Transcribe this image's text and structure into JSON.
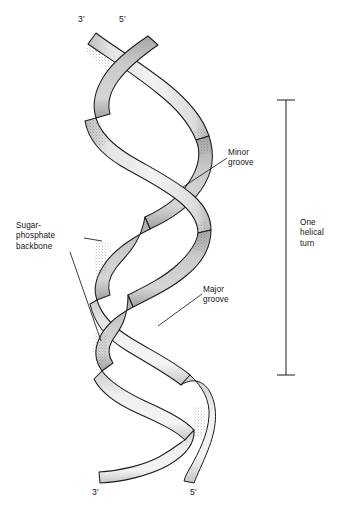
{
  "figure": {
    "background_color": "#ffffff",
    "line_color": "#1a1a1a",
    "ribbon_light_color": "#ececec",
    "ribbon_mid_color": "#c9c9c9",
    "ribbon_dark_color": "#a8a8a8",
    "stipple_color": "#4a4a4a"
  },
  "labels": {
    "sugar_phosphate_backbone": "Sugar-\nphosphate\nbackbone",
    "minor_groove": "Minor\ngroove",
    "major_groove": "Major\ngroove",
    "one_helical_turn": "One\nhelical\nturn"
  },
  "end_labels": {
    "top_left": "3′",
    "top_right": "5′",
    "bottom_left": "3′",
    "bottom_right": "5′"
  },
  "bracket": {
    "label": "One\nhelical\nturn",
    "orientation": "vertical",
    "x": 286,
    "top_y": 100,
    "bottom_y": 375,
    "cap_half_width": 9
  },
  "leader_lines": [
    {
      "name": "sugar-phosphate-upper",
      "from": [
        84,
        238
      ],
      "to": [
        101,
        241
      ]
    },
    {
      "name": "sugar-phosphate-lower",
      "from": [
        70,
        252
      ],
      "to": [
        101,
        341
      ]
    },
    {
      "name": "minor-groove",
      "from": [
        227,
        158
      ],
      "to": [
        183,
        187
      ]
    },
    {
      "name": "major-groove",
      "from": [
        202,
        294
      ],
      "to": [
        158,
        326
      ]
    }
  ],
  "strands": [
    {
      "name": "strand-a",
      "five_prime_end": "top-right",
      "three_prime_end": "bottom-right"
    },
    {
      "name": "strand-b",
      "five_prime_end": "bottom-left",
      "three_prime_end": "top-left"
    }
  ]
}
